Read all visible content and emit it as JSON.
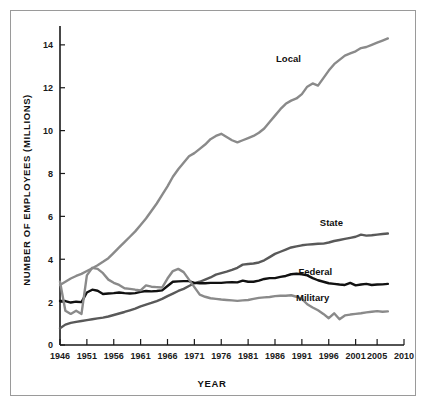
{
  "chart_data": {
    "type": "line",
    "title": "",
    "xlabel": "YEAR",
    "ylabel": "NUMBER OF EMPLOYEES (MILLIONS)",
    "xlim": [
      1946,
      2010
    ],
    "ylim": [
      0,
      14.6
    ],
    "xticks": [
      1946,
      1951,
      1956,
      1961,
      1966,
      1971,
      1976,
      1981,
      1986,
      1991,
      1996,
      2001,
      2005,
      2010
    ],
    "xtick_labels": [
      "1946",
      "1951",
      "1956",
      "1961",
      "1966",
      "1971",
      "1976",
      "1981",
      "1986",
      "1991",
      "1996",
      "2001",
      "2005",
      "2010"
    ],
    "yticks": [
      0,
      2,
      4,
      6,
      8,
      10,
      12,
      14
    ],
    "ytick_labels": [
      "0",
      "2",
      "4",
      "6",
      "8",
      "10",
      "12",
      "14"
    ],
    "grid": false,
    "legend_position": "inline-right-annotations",
    "series": [
      {
        "name": "Local",
        "label": "Local",
        "color": "#8a8a8a",
        "width": 2.4,
        "label_xy": [
          1988.5,
          13.2
        ],
        "x": [
          1946,
          1947,
          1948,
          1949,
          1950,
          1951,
          1952,
          1953,
          1954,
          1955,
          1956,
          1957,
          1958,
          1959,
          1960,
          1961,
          1962,
          1963,
          1964,
          1965,
          1966,
          1967,
          1968,
          1969,
          1970,
          1971,
          1972,
          1973,
          1974,
          1975,
          1976,
          1977,
          1978,
          1979,
          1980,
          1981,
          1982,
          1983,
          1984,
          1985,
          1986,
          1987,
          1988,
          1989,
          1990,
          1991,
          1992,
          1993,
          1994,
          1995,
          1996,
          1997,
          1998,
          1999,
          2000,
          2001,
          2002,
          2003,
          2004,
          2005,
          2006,
          2007
        ],
        "y": [
          2.8,
          2.95,
          3.1,
          3.22,
          3.32,
          3.45,
          3.58,
          3.72,
          3.88,
          4.05,
          4.3,
          4.55,
          4.8,
          5.05,
          5.3,
          5.6,
          5.9,
          6.25,
          6.6,
          7.0,
          7.4,
          7.85,
          8.2,
          8.5,
          8.8,
          8.95,
          9.15,
          9.35,
          9.6,
          9.75,
          9.85,
          9.7,
          9.55,
          9.45,
          9.55,
          9.65,
          9.75,
          9.9,
          10.1,
          10.4,
          10.7,
          11.0,
          11.25,
          11.4,
          11.5,
          11.7,
          12.05,
          12.2,
          12.1,
          12.45,
          12.8,
          13.1,
          13.3,
          13.5,
          13.6,
          13.7,
          13.85,
          13.9,
          14.0,
          14.1,
          14.2,
          14.3
        ]
      },
      {
        "name": "State",
        "label": "State",
        "color": "#595959",
        "width": 2.4,
        "label_xy": [
          1996.5,
          5.55
        ],
        "x": [
          1946,
          1947,
          1948,
          1949,
          1950,
          1951,
          1952,
          1953,
          1954,
          1955,
          1956,
          1957,
          1958,
          1959,
          1960,
          1961,
          1962,
          1963,
          1964,
          1965,
          1966,
          1967,
          1968,
          1969,
          1970,
          1971,
          1972,
          1973,
          1974,
          1975,
          1976,
          1977,
          1978,
          1979,
          1980,
          1981,
          1982,
          1983,
          1984,
          1985,
          1986,
          1987,
          1988,
          1989,
          1990,
          1991,
          1992,
          1993,
          1994,
          1995,
          1996,
          1997,
          1998,
          1999,
          2000,
          2001,
          2002,
          2003,
          2004,
          2005,
          2006,
          2007
        ],
        "y": [
          0.78,
          0.95,
          1.03,
          1.08,
          1.12,
          1.16,
          1.2,
          1.24,
          1.28,
          1.33,
          1.4,
          1.47,
          1.54,
          1.62,
          1.7,
          1.8,
          1.88,
          1.96,
          2.05,
          2.15,
          2.28,
          2.4,
          2.52,
          2.62,
          2.75,
          2.88,
          2.95,
          3.05,
          3.15,
          3.28,
          3.35,
          3.42,
          3.5,
          3.6,
          3.75,
          3.78,
          3.8,
          3.85,
          3.95,
          4.1,
          4.25,
          4.35,
          4.45,
          4.55,
          4.6,
          4.65,
          4.68,
          4.7,
          4.72,
          4.73,
          4.78,
          4.85,
          4.9,
          4.95,
          5.0,
          5.05,
          5.15,
          5.1,
          5.12,
          5.15,
          5.18,
          5.2
        ]
      },
      {
        "name": "Federal",
        "label": "Federal",
        "color": "#111111",
        "width": 2.4,
        "label_xy": [
          1993.5,
          3.25
        ],
        "x": [
          1946,
          1947,
          1948,
          1949,
          1950,
          1951,
          1952,
          1953,
          1954,
          1955,
          1956,
          1957,
          1958,
          1959,
          1960,
          1961,
          1962,
          1963,
          1964,
          1965,
          1966,
          1967,
          1968,
          1969,
          1970,
          1971,
          1972,
          1973,
          1974,
          1975,
          1976,
          1977,
          1978,
          1979,
          1980,
          1981,
          1982,
          1983,
          1984,
          1985,
          1986,
          1987,
          1988,
          1989,
          1990,
          1991,
          1992,
          1993,
          1994,
          1995,
          1996,
          1997,
          1998,
          1999,
          2000,
          2001,
          2002,
          2003,
          2004,
          2005,
          2006,
          2007
        ],
        "y": [
          2.05,
          2.05,
          1.98,
          2.02,
          2.0,
          2.45,
          2.58,
          2.53,
          2.38,
          2.4,
          2.42,
          2.45,
          2.42,
          2.4,
          2.42,
          2.48,
          2.52,
          2.5,
          2.52,
          2.55,
          2.75,
          2.95,
          2.97,
          2.98,
          2.98,
          2.9,
          2.88,
          2.88,
          2.9,
          2.9,
          2.9,
          2.92,
          2.93,
          2.92,
          3.0,
          2.95,
          2.95,
          3.0,
          3.08,
          3.12,
          3.12,
          3.18,
          3.22,
          3.3,
          3.32,
          3.3,
          3.25,
          3.12,
          3.02,
          2.95,
          2.88,
          2.85,
          2.82,
          2.8,
          2.9,
          2.78,
          2.82,
          2.85,
          2.8,
          2.82,
          2.83,
          2.85
        ]
      },
      {
        "name": "Military",
        "label": "Military",
        "color": "#8a8a8a",
        "width": 2.4,
        "label_xy": [
          1993.0,
          2.05
        ],
        "x": [
          1946,
          1947,
          1948,
          1949,
          1950,
          1951,
          1952,
          1953,
          1954,
          1955,
          1956,
          1957,
          1958,
          1959,
          1960,
          1961,
          1962,
          1963,
          1964,
          1965,
          1966,
          1967,
          1968,
          1969,
          1970,
          1971,
          1972,
          1973,
          1974,
          1975,
          1976,
          1977,
          1978,
          1979,
          1980,
          1981,
          1982,
          1983,
          1984,
          1985,
          1986,
          1987,
          1988,
          1989,
          1990,
          1991,
          1992,
          1993,
          1994,
          1995,
          1996,
          1997,
          1998,
          1999,
          2000,
          2001,
          2002,
          2003,
          2004,
          2005,
          2006,
          2007
        ],
        "y": [
          2.95,
          1.6,
          1.45,
          1.6,
          1.45,
          3.25,
          3.6,
          3.55,
          3.35,
          3.05,
          2.9,
          2.8,
          2.65,
          2.62,
          2.58,
          2.55,
          2.78,
          2.72,
          2.7,
          2.68,
          3.1,
          3.45,
          3.55,
          3.4,
          3.05,
          2.7,
          2.35,
          2.25,
          2.18,
          2.15,
          2.12,
          2.1,
          2.08,
          2.06,
          2.08,
          2.1,
          2.15,
          2.2,
          2.22,
          2.24,
          2.28,
          2.3,
          2.3,
          2.32,
          2.25,
          2.15,
          1.9,
          1.75,
          1.62,
          1.45,
          1.25,
          1.48,
          1.2,
          1.38,
          1.42,
          1.45,
          1.48,
          1.52,
          1.55,
          1.58,
          1.55,
          1.57
        ]
      }
    ]
  },
  "axes": {
    "y_title": "NUMBER OF EMPLOYEES (MILLIONS)",
    "x_title": "YEAR"
  }
}
